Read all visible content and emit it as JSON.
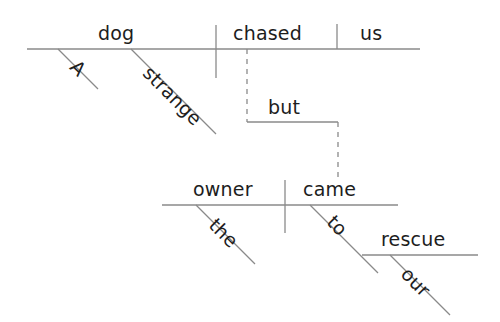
{
  "diagram": {
    "type": "reed-kellogg-sentence-diagram",
    "sentence": "A strange dog chased us, but our owner came to our rescue.",
    "line_color": "#8a8a8a",
    "text_color": "#1d1d1d",
    "background_color": "#ffffff",
    "clauses": [
      {
        "name": "independent-clause-1",
        "subject": "dog",
        "verb": "chased",
        "object": "us",
        "modifiers": [
          {
            "word": "A",
            "modifies": "dog"
          },
          {
            "word": "strange",
            "modifies": "dog"
          }
        ]
      },
      {
        "name": "independent-clause-2",
        "subject": "owner",
        "verb": "came",
        "modifiers": [
          {
            "word": "the",
            "modifies": "owner"
          }
        ],
        "prepositional_phrase": {
          "preposition": "to",
          "object": "rescue",
          "modifiers": [
            {
              "word": "our",
              "modifies": "rescue"
            }
          ]
        }
      }
    ],
    "conjunction": {
      "word": "but",
      "connects": [
        "independent-clause-1",
        "independent-clause-2"
      ],
      "line_style": "dashed"
    },
    "words": {
      "article_a": "A",
      "adjective_strange": "strange",
      "subject_dog": "dog",
      "verb_chased": "chased",
      "object_us": "us",
      "conjunction_but": "but",
      "article_the": "the",
      "subject_owner": "owner",
      "verb_came": "came",
      "preposition_to": "to",
      "possessive_our": "our",
      "noun_rescue": "rescue"
    }
  }
}
